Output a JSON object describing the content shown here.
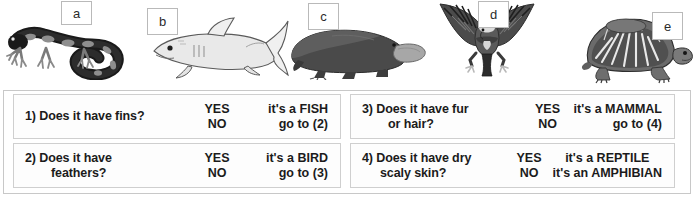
{
  "figure": {
    "animals": [
      {
        "letter": "a",
        "name": "salamander",
        "icon": "salamander-icon"
      },
      {
        "letter": "b",
        "name": "shark",
        "icon": "shark-icon"
      },
      {
        "letter": "c",
        "name": "platypus",
        "icon": "platypus-icon"
      },
      {
        "letter": "d",
        "name": "eagle",
        "icon": "eagle-icon"
      },
      {
        "letter": "e",
        "name": "tortoise",
        "icon": "tortoise-icon"
      }
    ]
  },
  "key_table": {
    "rows": [
      {
        "id": "1",
        "number": "1)",
        "question_line1": "Does it have fins?",
        "question_line2": "",
        "answers": [
          "YES",
          "NO"
        ],
        "results": [
          "it's a FISH",
          "go to (2)"
        ]
      },
      {
        "id": "2",
        "number": "2)",
        "question_line1": "Does it have",
        "question_line2": "feathers?",
        "answers": [
          "YES",
          "NO"
        ],
        "results": [
          "it's a BIRD",
          "go to (3)"
        ]
      },
      {
        "id": "3",
        "number": "3)",
        "question_line1": "Does it have fur",
        "question_line2": "or hair?",
        "answers": [
          "YES",
          "NO"
        ],
        "results": [
          "it's a MAMMAL",
          "go to (4)"
        ]
      },
      {
        "id": "4",
        "number": "4)",
        "question_line1": "Does it have dry",
        "question_line2": "scaly skin?",
        "answers": [
          "YES",
          "NO"
        ],
        "results": [
          "it's a REPTILE",
          "it's an AMPHIBIAN"
        ]
      }
    ]
  },
  "colors": {
    "text": "#1b1b1b",
    "cell_border": "#cfcfcf",
    "frame_border": "#c8c8c8",
    "label_border": "#b9b9b9",
    "background": "#ffffff"
  }
}
